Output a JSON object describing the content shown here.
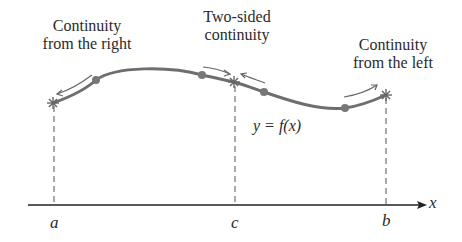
{
  "labels": {
    "continuity_right_line1": "Continuity",
    "continuity_right_line2": "from the right",
    "two_sided_line1": "Two-sided",
    "two_sided_line2": "continuity",
    "continuity_left_line1": "Continuity",
    "continuity_left_line2": "from the left",
    "function": "y = f(x)",
    "x_axis": "x",
    "point_a": "a",
    "point_c": "c",
    "point_b": "b"
  },
  "colors": {
    "curve": "#6e6e6e",
    "axis": "#222222",
    "dashed": "#555555",
    "text": "#2a2a2a"
  }
}
